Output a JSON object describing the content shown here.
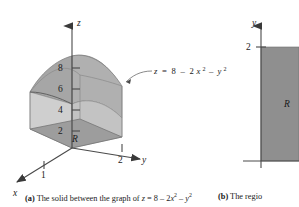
{
  "figure": {
    "panel_a": {
      "axes": {
        "z_label": "z",
        "x_label": "x",
        "y_label": "y",
        "z_ticks": [
          "2",
          "4",
          "6",
          "8"
        ],
        "x_ticks": [
          "1"
        ],
        "y_ticks": [
          "2"
        ]
      },
      "surface_equation": {
        "lhs": "z",
        "eq": "=",
        "c": "8",
        "minus1": "–",
        "t1_coef": "2",
        "t1_var": "x",
        "t1_pow": "2",
        "minus2": "–",
        "t2_var": "y",
        "t2_pow": "2"
      },
      "region_label": "R",
      "colors": {
        "top_surface": "#a8a8a8",
        "front_face": "#cfcfcf",
        "side_face": "#bdbdbd",
        "base_region": "#9a9a9a",
        "axis": "#4a4a4a"
      }
    },
    "panel_b": {
      "axes": {
        "y_label": "y",
        "y_ticks": [
          "2"
        ]
      },
      "region_label": "R",
      "colors": {
        "region_fill": "#8f8f8f",
        "axis": "#4a4a4a"
      }
    }
  },
  "captions": {
    "a": {
      "tag": "(a)",
      "text_before": "The solid between the graph of",
      "eq_lhs": "z",
      "eq_sign": "=",
      "eq_c": "8",
      "eq_minus1": "–",
      "eq_coef": "2",
      "eq_x": "x",
      "eq_xp": "2",
      "eq_minus2": "–",
      "eq_y": "y",
      "eq_yp": "2"
    },
    "b": {
      "tag": "(b)",
      "text": "The regio"
    }
  }
}
